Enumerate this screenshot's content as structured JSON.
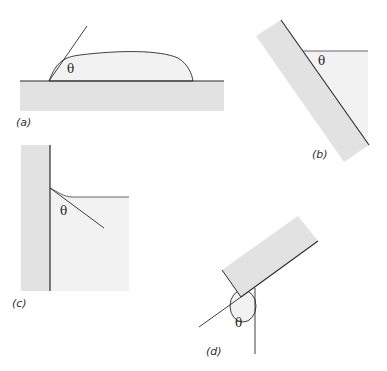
{
  "figure": {
    "colors": {
      "solid": "#e2e2e2",
      "liquid": "#f2f2f2",
      "line": "#2a2a2a",
      "background": "#ffffff"
    },
    "panels": [
      {
        "id": "a",
        "label": "(a)",
        "angle_symbol": "θ",
        "description": "sessile drop on horizontal surface"
      },
      {
        "id": "b",
        "label": "(b)",
        "angle_symbol": "θ",
        "description": "liquid against inclined plate"
      },
      {
        "id": "c",
        "label": "(c)",
        "angle_symbol": "θ",
        "description": "meniscus at vertical wall"
      },
      {
        "id": "d",
        "label": "(d)",
        "angle_symbol": "θ",
        "description": "contact angle at edge of tilted slab"
      }
    ]
  }
}
